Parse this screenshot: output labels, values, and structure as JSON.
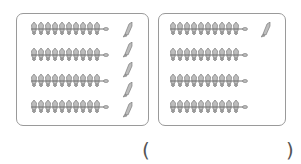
{
  "worksheet": {
    "groups": [
      {
        "name": "left",
        "bundles": 4,
        "fish_per_bundle": 10,
        "loose_fish": 5
      },
      {
        "name": "right",
        "bundles": 4,
        "fish_per_bundle": 10,
        "loose_fish": 1
      }
    ],
    "answer": {
      "open_paren": "(",
      "close_paren": ")",
      "value": ""
    },
    "colors": {
      "outline": "#9a9a9a",
      "fish": "#6e6e6e"
    }
  }
}
